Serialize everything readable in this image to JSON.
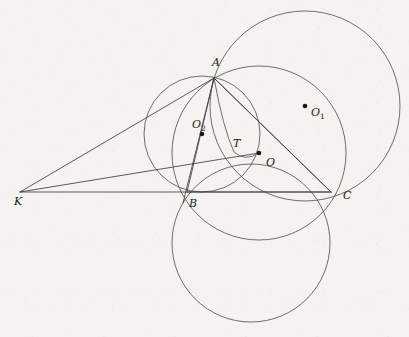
{
  "figure": {
    "kind": "euclidean-geometry-diagram",
    "background_color": "#f4f3f0",
    "stroke_color": "#4a4a4a",
    "width": 409,
    "height": 337,
    "points": [
      {
        "id": "A",
        "label": "A",
        "sub": "",
        "x": 214,
        "y": 78,
        "label_x": 212,
        "label_y": 66,
        "dotted": false
      },
      {
        "id": "B",
        "label": "B",
        "sub": "",
        "x": 187,
        "y": 192,
        "label_x": 189,
        "label_y": 207,
        "dotted": false
      },
      {
        "id": "C",
        "label": "C",
        "sub": "",
        "x": 331,
        "y": 192,
        "label_x": 343,
        "label_y": 199,
        "dotted": false
      },
      {
        "id": "K",
        "label": "K",
        "sub": "",
        "x": 20,
        "y": 192,
        "label_x": 14,
        "label_y": 205,
        "dotted": false
      },
      {
        "id": "O",
        "label": "O",
        "sub": "",
        "x": 259,
        "y": 153,
        "label_x": 266,
        "label_y": 166,
        "dotted": true
      },
      {
        "id": "T",
        "label": "T",
        "sub": "",
        "x": 234,
        "y": 152,
        "label_x": 233,
        "label_y": 147,
        "dotted": false
      },
      {
        "id": "O1",
        "label": "O",
        "sub": "1",
        "x": 305,
        "y": 106,
        "label_x": 311,
        "label_y": 116,
        "dotted": true
      },
      {
        "id": "O2",
        "label": "O",
        "sub": "2",
        "x": 202,
        "y": 134,
        "label_x": 192,
        "label_y": 128,
        "dotted": true
      }
    ],
    "circles": [
      {
        "id": "circle-O1",
        "name": "large-circle-through-A-and-C",
        "cx": 305,
        "cy": 106,
        "r": 95
      },
      {
        "id": "circle-O2",
        "name": "circle-through-A-and-B",
        "cx": 202,
        "cy": 134,
        "r": 58
      },
      {
        "id": "circle-BC",
        "name": "lower-circle-through-B-and-C",
        "cx": 251,
        "cy": 243,
        "r": 79
      },
      {
        "id": "circle-ABC",
        "name": "circumcircle-of-triangle-ABC",
        "cx": 259,
        "cy": 153,
        "r": 87
      }
    ],
    "segments": [
      {
        "id": "KA",
        "name": "segment-K-to-A",
        "x1": 20,
        "y1": 192,
        "x2": 214,
        "y2": 78
      },
      {
        "id": "KO",
        "name": "segment-K-to-O",
        "x1": 20,
        "y1": 192,
        "x2": 259,
        "y2": 153
      },
      {
        "id": "KC",
        "name": "segment-K-to-C",
        "x1": 20,
        "y1": 192,
        "x2": 331,
        "y2": 192
      },
      {
        "id": "AB",
        "name": "segment-A-to-B",
        "x1": 214,
        "y1": 78,
        "x2": 187,
        "y2": 192
      },
      {
        "id": "AC",
        "name": "segment-A-to-C",
        "x1": 214,
        "y1": 78,
        "x2": 331,
        "y2": 192
      },
      {
        "id": "AO",
        "name": "segment-A-through-T-and-O-to-C",
        "x1": 214,
        "y1": 78,
        "x2": 331,
        "y2": 192
      },
      {
        "id": "BC",
        "name": "segment-B-to-C",
        "x1": 187,
        "y1": 192,
        "x2": 331,
        "y2": 192
      },
      {
        "id": "AO2",
        "name": "segment-A-through-O2-to-B",
        "x1": 214,
        "y1": 78,
        "x2": 183,
        "y2": 203
      }
    ],
    "arcs": [
      {
        "id": "arc-A-T-O",
        "name": "arc-from-A-through-T-to-O",
        "d": "M 214 78 Q 223 128 234 152 Q 245 162 259 153"
      }
    ]
  }
}
